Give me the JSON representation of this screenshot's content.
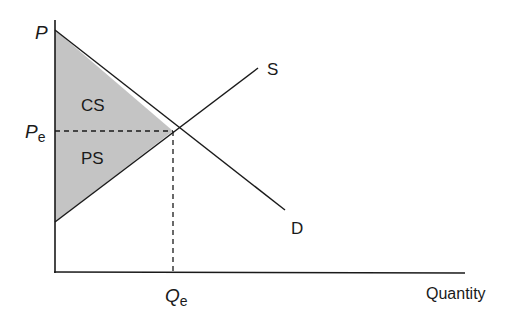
{
  "diagram": {
    "type": "supply-demand",
    "y_axis_label": "P",
    "x_axis_label": "Quantity",
    "price_eq_label": "P",
    "price_eq_sub": "e",
    "qty_eq_label": "Q",
    "qty_eq_sub": "e",
    "supply_label": "S",
    "demand_label": "D",
    "consumer_surplus_label": "CS",
    "producer_surplus_label": "PS",
    "colors": {
      "line": "#1a1a1a",
      "surplus_fill": "#c4c4c4",
      "background": "#ffffff"
    }
  }
}
